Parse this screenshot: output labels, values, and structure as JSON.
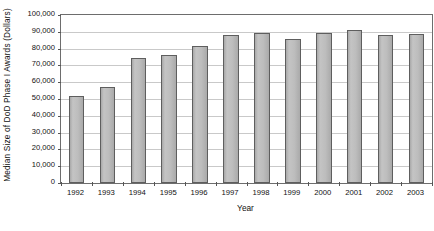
{
  "chart_data": {
    "type": "bar",
    "title": "",
    "xlabel": "Year",
    "ylabel": "Median Size of DoD Phase I Awards (Dollars)",
    "categories": [
      "1992",
      "1993",
      "1994",
      "1995",
      "1996",
      "1997",
      "1998",
      "1999",
      "2000",
      "2001",
      "2002",
      "2003"
    ],
    "values": [
      52000,
      57000,
      74500,
      76000,
      81500,
      88000,
      89000,
      86000,
      89500,
      91000,
      88000,
      88500
    ],
    "series": [
      {
        "name": "Median Size of DoD Phase I Awards",
        "values": [
          52000,
          57000,
          74500,
          76000,
          81500,
          88000,
          89000,
          86000,
          89500,
          91000,
          88000,
          88500
        ]
      }
    ],
    "ylim": [
      0,
      100000
    ],
    "ytick_labels": [
      "100,000",
      "90,000",
      "80,000",
      "70,000",
      "60,000",
      "50,000",
      "40,000",
      "30,000",
      "20,000",
      "10,000",
      "0"
    ],
    "ytick_values": [
      100000,
      90000,
      80000,
      70000,
      60000,
      50000,
      40000,
      30000,
      20000,
      10000,
      0
    ],
    "grid": true,
    "grid_axis": "y",
    "legend": false,
    "legend_position": "none",
    "bar_fill_color": "#bdbdbd",
    "bar_border_color": "#5e5e5e",
    "gridline_color": "#c9c9c9",
    "axis_color": "#6d6d6d",
    "background_color": "#ffffff",
    "text_color": "#111111"
  }
}
